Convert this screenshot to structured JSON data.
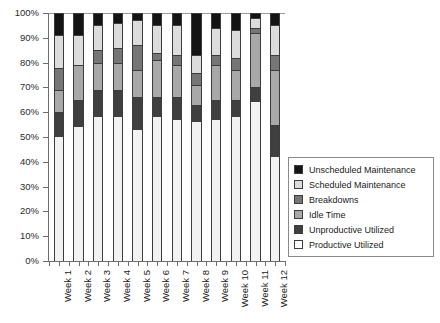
{
  "chart_data": {
    "type": "bar",
    "variant": "stacked-100-percent",
    "title": "",
    "xlabel": "",
    "ylabel": "",
    "ylim": [
      0,
      100
    ],
    "yunit": "%",
    "grid": false,
    "legend_position": "right",
    "categories": [
      "Week 1",
      "Week 2",
      "Week 3",
      "Week 4",
      "Week 5",
      "Week 6",
      "Week 7",
      "Week 8",
      "Week 9",
      "Week 10",
      "Week 11",
      "Week 12"
    ],
    "ytick_labels": [
      "0%",
      "10%",
      "20%",
      "30%",
      "40%",
      "50%",
      "60%",
      "70%",
      "80%",
      "90%",
      "100%"
    ],
    "ytick_values": [
      0,
      10,
      20,
      30,
      40,
      50,
      60,
      70,
      80,
      90,
      100
    ],
    "series": [
      {
        "name": "Productive Utilized",
        "color": "#f2f2f2",
        "values": [
          50,
          54,
          58,
          58,
          53,
          58,
          57,
          56,
          57,
          58,
          64,
          42
        ]
      },
      {
        "name": "Unproductive Utilized",
        "color": "#3f3f3f",
        "values": [
          10,
          11,
          11,
          11,
          13,
          8,
          9,
          7,
          8,
          7,
          6,
          13
        ]
      },
      {
        "name": "Idle Time",
        "color": "#a8a8a8",
        "values": [
          9,
          14,
          11,
          11,
          11,
          15,
          13,
          8,
          14,
          12,
          22,
          22
        ]
      },
      {
        "name": "Breakdowns",
        "color": "#767676",
        "values": [
          9,
          0,
          5,
          6,
          10,
          3,
          4,
          5,
          4,
          5,
          2,
          6
        ]
      },
      {
        "name": "Scheduled Maintenance",
        "color": "#dcdcdc",
        "values": [
          13,
          12,
          10,
          10,
          10,
          11,
          12,
          7,
          11,
          11,
          4,
          12
        ]
      },
      {
        "name": "Unscheduled Maintenance",
        "color": "#141414",
        "values": [
          9,
          9,
          5,
          4,
          3,
          5,
          5,
          17,
          6,
          7,
          2,
          5
        ]
      }
    ],
    "legend_entries": [
      {
        "label": "Unscheduled Maintenance",
        "color": "#141414"
      },
      {
        "label": "Scheduled Maintenance",
        "color": "#dcdcdc"
      },
      {
        "label": "Breakdowns",
        "color": "#767676"
      },
      {
        "label": "Idle Time",
        "color": "#a8a8a8"
      },
      {
        "label": "Unproductive Utilized",
        "color": "#3f3f3f"
      },
      {
        "label": "Productive Utilized",
        "color": "#ffffff"
      }
    ]
  }
}
